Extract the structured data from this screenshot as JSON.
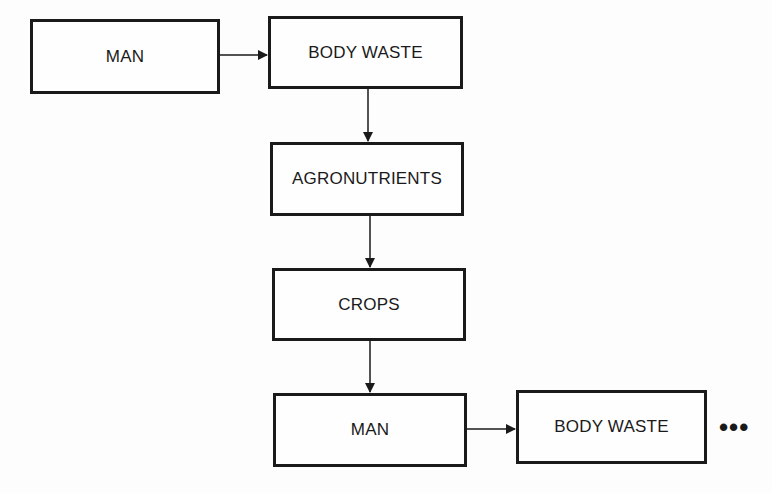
{
  "diagram": {
    "title": "",
    "nodes": [
      {
        "id": "man1",
        "label": "MAN"
      },
      {
        "id": "body_waste1",
        "label": "BODY WASTE"
      },
      {
        "id": "agronutrients",
        "label": "AGRONUTRIENTS"
      },
      {
        "id": "crops",
        "label": "CROPS"
      },
      {
        "id": "man2",
        "label": "MAN"
      },
      {
        "id": "body_waste2",
        "label": "BODY WASTE"
      }
    ],
    "edges": [
      {
        "from": "man1",
        "to": "body_waste1"
      },
      {
        "from": "body_waste1",
        "to": "agronutrients"
      },
      {
        "from": "agronutrients",
        "to": "crops"
      },
      {
        "from": "crops",
        "to": "man2"
      },
      {
        "from": "man2",
        "to": "body_waste2"
      }
    ],
    "continuation": "•••",
    "colors": {
      "stroke": "#1a1a1a",
      "background": "#fdfdfd"
    }
  }
}
